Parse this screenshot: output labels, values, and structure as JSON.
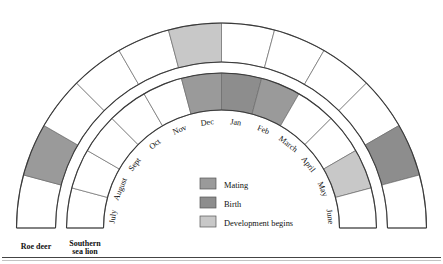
{
  "chart_data": {
    "type": "bar",
    "title": "",
    "subtitle": "",
    "xlabel": "",
    "ylabel": "",
    "layout": "semicircular double-band annual cycle chart, 12 monthly sectors, arc spans 180 degrees from left (July) over the top (Dec/Jan) to right (June)",
    "grid": false,
    "legend_position": "center-bottom-inside",
    "categories": [
      "July",
      "August",
      "Sept",
      "Oct",
      "Nov",
      "Dec",
      "Jan",
      "Feb",
      "March",
      "April",
      "May",
      "June"
    ],
    "series": [
      {
        "name": "Roe deer",
        "band": "outer",
        "values": [
          "none",
          "mating",
          "none",
          "none",
          "none",
          "development",
          "none",
          "none",
          "none",
          "none",
          "birth",
          "none"
        ]
      },
      {
        "name": "Southern sea lion",
        "band": "inner",
        "values": [
          "none",
          "none",
          "none",
          "none",
          "none",
          "mating",
          "birth",
          "mating",
          "none",
          "none",
          "development",
          "none"
        ]
      }
    ],
    "state_colors": {
      "mating": "#9a9a9a",
      "birth": "#8d8d8d",
      "development": "#c8c8c8",
      "none": "#ffffff"
    }
  },
  "figure": {
    "month_labels": [
      {
        "text": "July"
      },
      {
        "text": "August"
      },
      {
        "text": "Sept"
      },
      {
        "text": "Oct"
      },
      {
        "text": "Nov"
      },
      {
        "text": "Dec"
      },
      {
        "text": "Jan"
      },
      {
        "text": "Feb"
      },
      {
        "text": "March"
      },
      {
        "text": "April"
      },
      {
        "text": "May"
      },
      {
        "text": "June"
      }
    ],
    "series_labels": {
      "outer_line1": "Roe deer",
      "outer_line2": "",
      "inner_line1": "Southern",
      "inner_line2": "sea lion"
    },
    "legend": {
      "items": [
        {
          "label": "Mating",
          "color": "#9a9a9a"
        },
        {
          "label": "Birth",
          "color": "#8d8d8d"
        },
        {
          "label": "Development begins",
          "color": "#c8c8c8"
        }
      ]
    }
  }
}
